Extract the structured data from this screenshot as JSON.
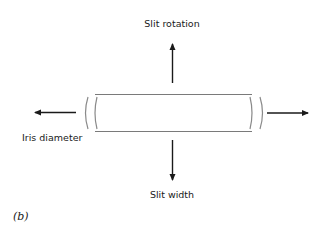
{
  "diagram": {
    "panel_label": "(b)",
    "labels": {
      "top": "Slit rotation",
      "left": "Iris diameter",
      "bottom": "Slit width"
    },
    "arrows": [
      {
        "id": "up",
        "direction": "up",
        "label": "Slit rotation"
      },
      {
        "id": "left",
        "direction": "left",
        "label": "Iris diameter"
      },
      {
        "id": "right",
        "direction": "right",
        "label": ""
      },
      {
        "id": "down",
        "direction": "down",
        "label": "Slit width"
      }
    ],
    "colors": {
      "arrow": "#1a1a1a",
      "slit_outline": "#7a7a7a",
      "background": "#ffffff"
    }
  }
}
